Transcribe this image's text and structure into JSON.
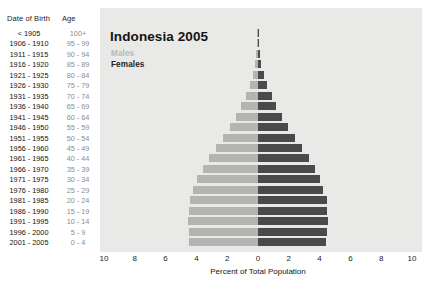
{
  "table_headers": {
    "dob": "Date of Birth",
    "age": "Age"
  },
  "legend": {
    "males": "Males",
    "females": "Females"
  },
  "colors": {
    "male_bar": "#b4b4b2",
    "female_bar": "#4a4a4a",
    "plot_background": "#e9e9e7",
    "page_background": "#ffffff",
    "age_label": "#8e8e8e",
    "dob_label": "#111111"
  },
  "chart_data": {
    "type": "bar",
    "subtype": "population-pyramid",
    "title": "Indonesia 2005",
    "xlabel": "Percent of Total Population",
    "ylabel": "",
    "xlim": [
      -10,
      10
    ],
    "xticks": [
      10,
      8,
      6,
      4,
      2,
      0,
      2,
      4,
      6,
      8,
      10
    ],
    "grid": false,
    "legend_position": "top-left",
    "categories": [
      "100+",
      "95 - 99",
      "90 - 94",
      "85 - 89",
      "80 - 84",
      "75 - 79",
      "70 - 74",
      "65 - 69",
      "60 - 64",
      "55 - 59",
      "50 - 54",
      "45 - 49",
      "40 - 44",
      "35 - 39",
      "30 - 34",
      "25 - 29",
      "20 - 24",
      "15 - 19",
      "10 - 14",
      "5 - 9",
      "0 - 4"
    ],
    "date_of_birth": [
      "< 1905",
      "1906 - 1910",
      "1911 - 1915",
      "1916 - 1920",
      "1921 - 1925",
      "1926 - 1930",
      "1931 - 1935",
      "1936 - 1940",
      "1941 - 1945",
      "1946 - 1950",
      "1951 - 1955",
      "1956 - 1960",
      "1961 - 1965",
      "1966 - 1970",
      "1971 - 1975",
      "1976 - 1980",
      "1981 - 1985",
      "1986 - 1990",
      "1991 - 1995",
      "1996 - 2000",
      "2001 - 2005"
    ],
    "series": [
      {
        "name": "Males",
        "direction": "left",
        "values": [
          0.02,
          0.05,
          0.1,
          0.2,
          0.35,
          0.55,
          0.8,
          1.1,
          1.45,
          1.85,
          2.3,
          2.75,
          3.2,
          3.6,
          3.95,
          4.2,
          4.4,
          4.5,
          4.55,
          4.5,
          4.45
        ]
      },
      {
        "name": "Females",
        "direction": "right",
        "values": [
          0.02,
          0.05,
          0.12,
          0.22,
          0.4,
          0.6,
          0.88,
          1.2,
          1.55,
          1.95,
          2.4,
          2.85,
          3.3,
          3.7,
          4.0,
          4.25,
          4.45,
          4.5,
          4.55,
          4.5,
          4.4
        ]
      }
    ]
  }
}
